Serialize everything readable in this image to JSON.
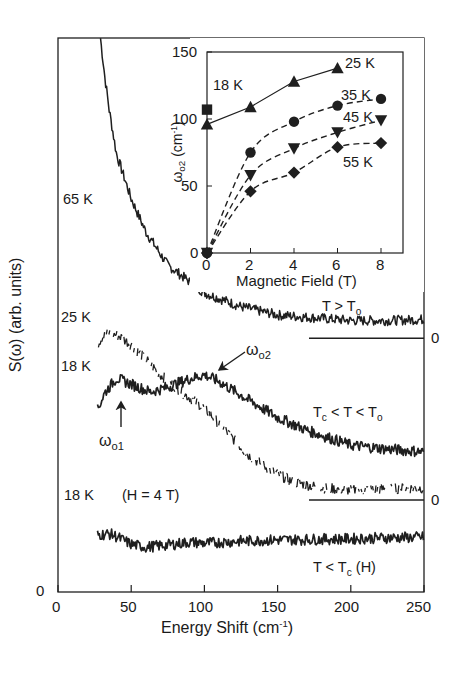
{
  "chart_data": [
    {
      "id": "main",
      "type": "line",
      "title": "",
      "xlabel": "Energy Shift (cm-1)",
      "xlabel_text": "Energy Shift (cm",
      "xlabel_sup": "-1",
      "xlabel_end": ")",
      "ylabel": "S(ω)  (arb. units)",
      "xlim": [
        0,
        250
      ],
      "ylim": [
        0,
        10
      ],
      "xticks": [
        "0",
        "50",
        "100",
        "150",
        "200",
        "250"
      ],
      "yticks": [
        "0"
      ],
      "grid": false,
      "series": [
        {
          "name": "65 K",
          "label": "65 K",
          "style": "solid",
          "regime": "T > To",
          "baseline": 4.58,
          "x": [
            29,
            32,
            35,
            40,
            45,
            50,
            60,
            75,
            90,
            100,
            125,
            150,
            175,
            200,
            225,
            250
          ],
          "y": [
            10.0,
            9.3,
            8.7,
            7.9,
            7.5,
            7.1,
            6.5,
            5.9,
            5.6,
            5.4,
            5.15,
            5.0,
            4.95,
            4.9,
            4.9,
            4.92
          ]
        },
        {
          "name": "25 K",
          "label": "25 K",
          "style": "dotted",
          "regime": "Tc < T < To",
          "baseline": 1.66,
          "x": [
            27,
            30,
            35,
            42,
            50,
            60,
            70,
            85,
            100,
            115,
            130,
            145,
            160,
            180,
            200,
            225,
            250
          ],
          "y": [
            4.46,
            4.6,
            4.68,
            4.62,
            4.46,
            4.2,
            3.92,
            3.6,
            3.32,
            2.9,
            2.47,
            2.2,
            1.99,
            1.88,
            1.84,
            1.86,
            1.88
          ]
        },
        {
          "name": "18 K",
          "label": "18 K",
          "style": "solid",
          "regime": "Tc < T < To",
          "baseline": 1.66,
          "x": [
            27,
            32,
            40,
            50,
            63,
            75,
            90,
            100,
            110,
            130,
            150,
            170,
            200,
            225,
            250
          ],
          "y": [
            3.29,
            3.6,
            3.86,
            3.75,
            3.61,
            3.7,
            3.85,
            3.92,
            3.8,
            3.47,
            3.15,
            2.92,
            2.65,
            2.58,
            2.53
          ]
        },
        {
          "name": "18 K (H = 4 T)",
          "label": "18 K",
          "label_extra": "(H = 4 T)",
          "style": "solid",
          "regime": "T < Tc (H)",
          "x": [
            27,
            35,
            40,
            50,
            60,
            75,
            90,
            100,
            125,
            150,
            175,
            200,
            225,
            250
          ],
          "y": [
            1.03,
            1.05,
            1.0,
            0.86,
            0.81,
            0.85,
            0.9,
            0.88,
            0.92,
            0.94,
            0.95,
            0.96,
            0.98,
            0.99
          ]
        }
      ],
      "annotations": [
        {
          "text": "ω",
          "sub": "o1",
          "x": 43,
          "target_y": 3.86,
          "arrow": "up"
        },
        {
          "text": "ω",
          "sub": "o2",
          "x": 100,
          "target_y": 3.92,
          "arrow": "down-left"
        },
        {
          "text": "T > T",
          "sub": "o"
        },
        {
          "text": "T",
          "sub": "c",
          "mid": " < T < T",
          "sub2": "o"
        },
        {
          "text": "T < T",
          "sub": "c",
          "end": " (H)"
        },
        {
          "text": "0",
          "role": "baseline-65K"
        },
        {
          "text": "0",
          "role": "baseline-18K-25K"
        }
      ]
    },
    {
      "id": "inset",
      "type": "scatter",
      "title": "",
      "xlabel": "Magnetic Field (T)",
      "ylabel": "ωo2 (cm-1)",
      "ylabel_parts": {
        "symbol": "ω",
        "sub": "o2",
        "unit": " (cm",
        "sup": "-1",
        "end": ")"
      },
      "xlim": [
        0,
        9
      ],
      "ylim": [
        0,
        150
      ],
      "xticks": [
        "0",
        "2",
        "4",
        "6",
        "8"
      ],
      "yticks": [
        "0",
        "50",
        "100",
        "150"
      ],
      "grid": false,
      "series": [
        {
          "name": "18 K",
          "marker": "square",
          "line": "none",
          "x": [
            0
          ],
          "y": [
            107
          ]
        },
        {
          "name": "25 K",
          "marker": "triangle-up",
          "line": "solid",
          "x": [
            0,
            2,
            4,
            6
          ],
          "y": [
            96,
            109,
            128,
            138
          ]
        },
        {
          "name": "35 K",
          "marker": "circle",
          "line": "dashed",
          "x": [
            0,
            2,
            4,
            6,
            8
          ],
          "y": [
            0,
            75,
            98,
            110,
            115
          ]
        },
        {
          "name": "45 K",
          "marker": "triangle-down",
          "line": "dashed",
          "x": [
            0,
            2,
            4,
            6,
            8
          ],
          "y": [
            0,
            58,
            78,
            90,
            99
          ]
        },
        {
          "name": "55 K",
          "marker": "diamond",
          "line": "dashed",
          "x": [
            0,
            2,
            4,
            6,
            8
          ],
          "y": [
            0,
            46,
            60,
            79,
            82
          ]
        }
      ]
    }
  ]
}
